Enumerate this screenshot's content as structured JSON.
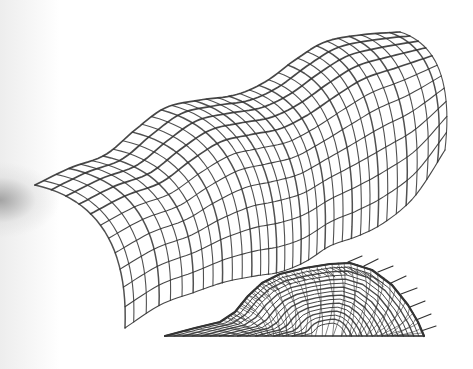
{
  "figure": {
    "background": "#ffffff",
    "stroke_color": "#333333",
    "upper_surface": {
      "name": "undulating-vault-gridshell",
      "ridge": [
        [
          35,
          185
        ],
        [
          70,
          168
        ],
        [
          105,
          155
        ],
        [
          135,
          130
        ],
        [
          165,
          108
        ],
        [
          200,
          100
        ],
        [
          235,
          95
        ],
        [
          265,
          82
        ],
        [
          295,
          60
        ],
        [
          325,
          42
        ],
        [
          360,
          35
        ],
        [
          400,
          32
        ]
      ],
      "base": [
        [
          125,
          328
        ],
        [
          160,
          305
        ],
        [
          195,
          292
        ],
        [
          225,
          282
        ],
        [
          255,
          276
        ],
        [
          280,
          272
        ],
        [
          305,
          262
        ],
        [
          330,
          246
        ],
        [
          358,
          236
        ],
        [
          385,
          222
        ],
        [
          415,
          196
        ],
        [
          445,
          150
        ]
      ],
      "arch_bulge": [
        -48,
        22
      ],
      "u_lines": 34,
      "v_lines": 11
    },
    "lower_surface": {
      "name": "dense-wireframe-dome",
      "outline": [
        [
          165,
          336
        ],
        [
          195,
          328
        ],
        [
          220,
          322
        ],
        [
          235,
          312
        ],
        [
          248,
          296
        ],
        [
          262,
          283
        ],
        [
          280,
          274
        ],
        [
          305,
          268
        ],
        [
          330,
          264
        ],
        [
          350,
          263
        ],
        [
          372,
          270
        ],
        [
          392,
          285
        ],
        [
          408,
          305
        ],
        [
          418,
          322
        ],
        [
          424,
          336
        ]
      ],
      "base_y": 336,
      "ticks": [
        [
          348,
          262,
          362,
          256
        ],
        [
          364,
          266,
          378,
          259
        ],
        [
          378,
          272,
          393,
          266
        ],
        [
          391,
          283,
          406,
          276
        ],
        [
          401,
          294,
          417,
          288
        ],
        [
          410,
          307,
          425,
          301
        ],
        [
          416,
          320,
          431,
          314
        ],
        [
          421,
          331,
          436,
          326
        ]
      ]
    }
  }
}
